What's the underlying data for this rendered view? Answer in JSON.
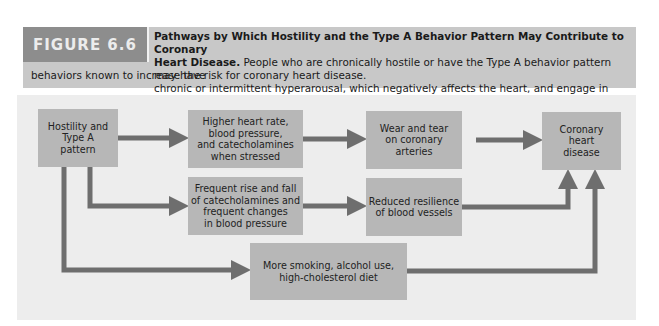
{
  "figure": {
    "label": "FIGURE 6.6",
    "title": "Pathways by Which Hostility and the Type A Behavior Pattern May Contribute to Coronary Heart Disease.",
    "caption_lines": [
      "Pathways by Which Hostility and the Type A Behavior Pattern May Contribute to Coronary",
      "Heart Disease.",
      " People who are chronically hostile or have the Type A behavior pattern may have",
      "chronic or intermittent hyperarousal, which negatively affects the heart, and engage in several",
      "behaviors known to increase the risk for coronary heart disease."
    ]
  },
  "diagram": {
    "nodes": {
      "source": "Hostility and Type A pattern",
      "higher_hr": "Higher heart rate, blood pressure, and catecholamines when stressed",
      "wear_tear": "Wear and tear on coronary arteries",
      "chd": "Coronary heart disease",
      "frequent_rise": "Frequent rise and fall of catecholamines and frequent changes in blood pressure",
      "reduced_resilience": "Reduced resilience of blood vessels",
      "smoking": "More smoking, alcohol use, high-cholesterol diet"
    },
    "node_lines": {
      "source": [
        "Hostility and",
        "Type A",
        "pattern"
      ],
      "higher_hr": [
        "Higher heart rate,",
        "blood pressure,",
        "and catecholamines",
        "when stressed"
      ],
      "wear_tear": [
        "Wear and tear",
        "on coronary",
        "arteries"
      ],
      "chd": [
        "Coronary",
        "heart",
        "disease"
      ],
      "frequent_rise": [
        "Frequent rise and fall",
        "of catecholamines and",
        "frequent changes",
        "in blood pressure"
      ],
      "reduced_resilience": [
        "Reduced resilience",
        "of blood vessels"
      ],
      "smoking": [
        "More smoking, alcohol use,",
        "high-cholesterol diet"
      ]
    },
    "edges": [
      [
        "source",
        "higher_hr"
      ],
      [
        "higher_hr",
        "wear_tear"
      ],
      [
        "wear_tear",
        "chd"
      ],
      [
        "source",
        "frequent_rise"
      ],
      [
        "frequent_rise",
        "reduced_resilience"
      ],
      [
        "reduced_resilience",
        "chd"
      ],
      [
        "source",
        "smoking"
      ],
      [
        "smoking",
        "chd"
      ]
    ]
  },
  "colors": {
    "label_bg": "#8d8d8d",
    "caption_bg": "#c8c8c8",
    "panel_bg": "#ededed",
    "box_bg": "#b7b7b7",
    "arrow": "#6e6e6e"
  }
}
